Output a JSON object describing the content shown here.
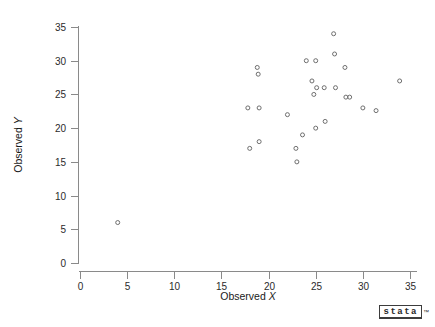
{
  "figure": {
    "title": "",
    "background_color": "#ffffff",
    "axis_color": "#8a8a8a",
    "marker_color": "#6e6e6e",
    "text_color": "#1a1a1a"
  },
  "branding": {
    "logo_text": "stata",
    "logo_trademark": "™"
  },
  "chart_data": {
    "type": "scatter",
    "title": "",
    "xlabel": "Observed X",
    "ylabel": "Observed Y",
    "xlim": [
      0,
      35
    ],
    "ylim": [
      0,
      35
    ],
    "xticks": [
      0,
      5,
      10,
      15,
      20,
      25,
      30,
      35
    ],
    "yticks": [
      0,
      5,
      10,
      15,
      20,
      25,
      30,
      35
    ],
    "xtick_labels": [
      "0",
      "5",
      "10",
      "15",
      "20",
      "25",
      "30",
      "35"
    ],
    "ytick_labels": [
      "0",
      "5",
      "10",
      "15",
      "20",
      "25",
      "30",
      "35"
    ],
    "grid": false,
    "legend": null,
    "marker_style": "open-circle",
    "marker_size": 4,
    "n_points": 29,
    "series": [
      {
        "name": "observations",
        "x": [
          4.0,
          17.8,
          18.0,
          18.8,
          18.9,
          19.0,
          19.0,
          22.0,
          22.9,
          23.0,
          23.6,
          24.0,
          24.6,
          24.8,
          25.0,
          25.0,
          25.1,
          25.9,
          26.0,
          26.9,
          27.0,
          27.1,
          28.1,
          28.2,
          28.6,
          30.0,
          31.4,
          33.9
        ],
        "y": [
          6.0,
          23.0,
          17.0,
          29.0,
          28.0,
          23.0,
          18.0,
          22.0,
          17.0,
          15.0,
          19.0,
          30.0,
          27.0,
          25.0,
          30.0,
          20.0,
          26.0,
          26.0,
          21.0,
          34.0,
          31.0,
          26.0,
          29.0,
          24.6,
          24.6,
          23.0,
          22.6,
          27.0
        ]
      }
    ]
  }
}
